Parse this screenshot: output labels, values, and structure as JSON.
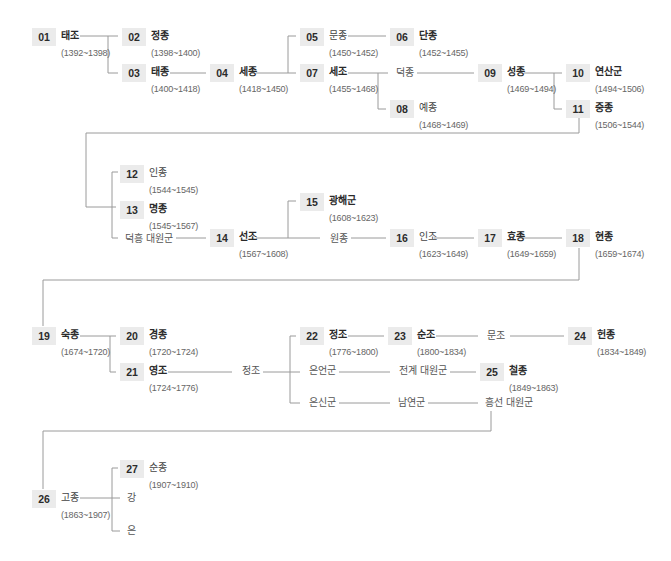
{
  "nodes": [
    {
      "id": "01",
      "name": "태조",
      "dates": "(1392~1398)",
      "bold": true,
      "x": 32,
      "y": 28
    },
    {
      "id": "02",
      "name": "정종",
      "dates": "(1398~1400)",
      "bold": true,
      "x": 122,
      "y": 28
    },
    {
      "id": "03",
      "name": "태종",
      "dates": "(1400~1418)",
      "bold": true,
      "x": 122,
      "y": 64
    },
    {
      "id": "04",
      "name": "세종",
      "dates": "(1418~1450)",
      "bold": true,
      "x": 210,
      "y": 64
    },
    {
      "id": "05",
      "name": "문종",
      "dates": "(1450~1452)",
      "bold": false,
      "x": 300,
      "y": 28
    },
    {
      "id": "06",
      "name": "단종",
      "dates": "(1452~1455)",
      "bold": true,
      "x": 390,
      "y": 28
    },
    {
      "id": "07",
      "name": "세조",
      "dates": "(1455~1468)",
      "bold": true,
      "x": 300,
      "y": 64
    },
    {
      "id": "08",
      "name": "예종",
      "dates": "(1468~1469)",
      "bold": false,
      "x": 390,
      "y": 100
    },
    {
      "id": "09",
      "name": "성종",
      "dates": "(1469~1494)",
      "bold": true,
      "x": 478,
      "y": 64
    },
    {
      "id": "10",
      "name": "연산군",
      "dates": "(1494~1506)",
      "bold": true,
      "x": 566,
      "y": 64
    },
    {
      "id": "11",
      "name": "중종",
      "dates": "(1506~1544)",
      "bold": true,
      "x": 566,
      "y": 100
    },
    {
      "id": "12",
      "name": "인종",
      "dates": "(1544~1545)",
      "bold": false,
      "x": 120,
      "y": 165
    },
    {
      "id": "13",
      "name": "명종",
      "dates": "(1545~1567)",
      "bold": true,
      "x": 120,
      "y": 201
    },
    {
      "id": "14",
      "name": "선조",
      "dates": "(1567~1608)",
      "bold": true,
      "x": 210,
      "y": 229
    },
    {
      "id": "15",
      "name": "광해군",
      "dates": "(1608~1623)",
      "bold": true,
      "x": 300,
      "y": 193
    },
    {
      "id": "16",
      "name": "인조",
      "dates": "(1623~1649)",
      "bold": false,
      "x": 390,
      "y": 229
    },
    {
      "id": "17",
      "name": "효종",
      "dates": "(1649~1659)",
      "bold": true,
      "x": 478,
      "y": 229
    },
    {
      "id": "18",
      "name": "현종",
      "dates": "(1659~1674)",
      "bold": true,
      "x": 566,
      "y": 229
    },
    {
      "id": "19",
      "name": "숙종",
      "dates": "(1674~1720)",
      "bold": true,
      "x": 32,
      "y": 327
    },
    {
      "id": "20",
      "name": "경종",
      "dates": "(1720~1724)",
      "bold": true,
      "x": 120,
      "y": 327
    },
    {
      "id": "21",
      "name": "영조",
      "dates": "(1724~1776)",
      "bold": true,
      "x": 120,
      "y": 363
    },
    {
      "id": "22",
      "name": "정조",
      "dates": "(1776~1800)",
      "bold": true,
      "x": 300,
      "y": 327
    },
    {
      "id": "23",
      "name": "순조",
      "dates": "(1800~1834)",
      "bold": true,
      "x": 388,
      "y": 327
    },
    {
      "id": "24",
      "name": "헌종",
      "dates": "(1834~1849)",
      "bold": true,
      "x": 568,
      "y": 327
    },
    {
      "id": "25",
      "name": "철종",
      "dates": "(1849~1863)",
      "bold": true,
      "x": 480,
      "y": 363
    },
    {
      "id": "26",
      "name": "고종",
      "dates": "(1863~1907)",
      "bold": false,
      "x": 32,
      "y": 490
    },
    {
      "id": "27",
      "name": "순종",
      "dates": "(1907~1910)",
      "bold": false,
      "x": 120,
      "y": 460
    }
  ],
  "labels": [
    {
      "text": "덕종",
      "x": 393,
      "y": 66
    },
    {
      "text": "덕흥 대원군",
      "x": 122,
      "y": 232
    },
    {
      "text": "원종",
      "x": 327,
      "y": 232
    },
    {
      "text": "정조",
      "x": 239,
      "y": 364
    },
    {
      "text": "문조",
      "x": 484,
      "y": 329
    },
    {
      "text": "은언군",
      "x": 306,
      "y": 364
    },
    {
      "text": "전계 대원군",
      "x": 396,
      "y": 364
    },
    {
      "text": "은신군",
      "x": 306,
      "y": 396
    },
    {
      "text": "남연군",
      "x": 395,
      "y": 396
    },
    {
      "text": "흥선 대원군",
      "x": 482,
      "y": 396
    },
    {
      "text": "강",
      "x": 124,
      "y": 491
    },
    {
      "text": "은",
      "x": 124,
      "y": 524
    }
  ],
  "line_color": "#9a9a9a",
  "box_color": "#ebebeb"
}
